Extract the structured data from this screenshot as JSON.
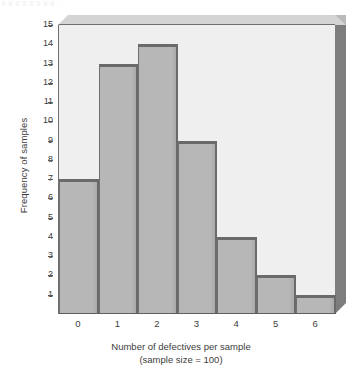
{
  "chart_data": {
    "type": "bar",
    "title": "",
    "subtitle": "",
    "xlabel": "Number of defectives per sample",
    "xlabel_line2": "(sample size = 100)",
    "ylabel": "Frequency of samples",
    "categories": [
      "0",
      "1",
      "2",
      "3",
      "4",
      "5",
      "6"
    ],
    "values": [
      7,
      13,
      14,
      9,
      4,
      2,
      1
    ],
    "ylim": [
      0,
      15
    ],
    "ytick_labels": [
      "15",
      "14",
      "13",
      "12",
      "11",
      "10",
      "9",
      "8",
      "7",
      "6",
      "5",
      "4",
      "3",
      "2",
      "1"
    ],
    "ytick_values": [
      15,
      14,
      13,
      12,
      11,
      10,
      9,
      8,
      7,
      6,
      5,
      4,
      3,
      2,
      1
    ],
    "grid": false,
    "legend": "none",
    "style": "3d-histogram",
    "bar_gap": 0
  },
  "colors": {
    "bar_fill": "#b7b7b7",
    "bar_edge": "#6a6a6a",
    "plot_background": "#efefef",
    "wall_right": "#7d7d7d",
    "wall_top": "#d4d4d4",
    "axis": "#5e5e5e",
    "text": "#3d3d3d",
    "page_background": "#ffffff"
  }
}
